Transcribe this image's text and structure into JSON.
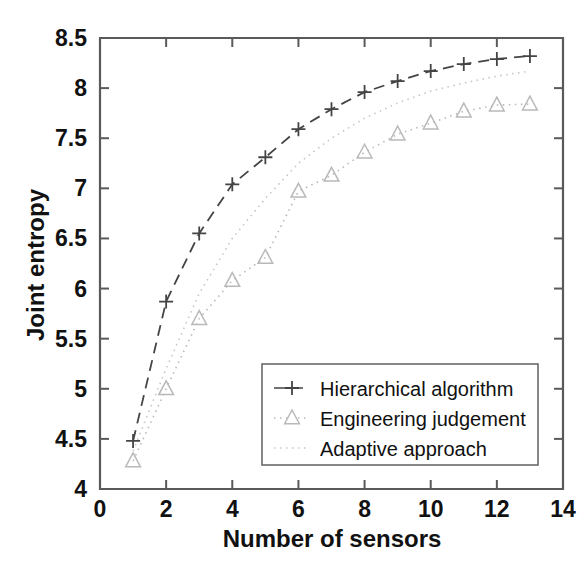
{
  "chart_data": {
    "type": "line",
    "title": "",
    "xlabel": "Number of sensors",
    "ylabel": "Joint entropy",
    "xlim": [
      0,
      14
    ],
    "ylim": [
      4,
      8.5
    ],
    "xticks": [
      0,
      2,
      4,
      6,
      8,
      10,
      12,
      14
    ],
    "yticks": [
      4,
      4.5,
      5,
      5.5,
      6,
      6.5,
      7,
      7.5,
      8,
      8.5
    ],
    "xticklabels": [
      "0",
      "2",
      "4",
      "6",
      "8",
      "10",
      "12",
      "14"
    ],
    "yticklabels": [
      "4",
      "4.5",
      "5",
      "5.5",
      "6",
      "6.5",
      "7",
      "7.5",
      "8",
      "8.5"
    ],
    "grid": false,
    "legend_position": "lower right",
    "x": [
      1,
      2,
      3,
      4,
      5,
      6,
      7,
      8,
      9,
      10,
      11,
      12,
      13
    ],
    "series": [
      {
        "name": "Hierarchical algorithm",
        "marker": "plus",
        "linestyle": "dashed",
        "color": "#444444",
        "values": [
          4.48,
          5.87,
          6.55,
          7.04,
          7.31,
          7.59,
          7.79,
          7.96,
          8.07,
          8.17,
          8.24,
          8.29,
          8.32
        ]
      },
      {
        "name": "Engineering judgement",
        "marker": "triangle",
        "linestyle": "dotted",
        "color": "#b9b9b9",
        "values": [
          4.28,
          5.0,
          5.7,
          6.08,
          6.31,
          6.97,
          7.13,
          7.36,
          7.54,
          7.65,
          7.77,
          7.83,
          7.84
        ]
      },
      {
        "name": "Adaptive approach",
        "marker": "none",
        "linestyle": "dotted",
        "color": "#c6c6c6",
        "values": [
          4.38,
          5.2,
          5.95,
          6.5,
          6.9,
          7.25,
          7.5,
          7.7,
          7.85,
          7.97,
          8.05,
          8.12,
          8.17
        ]
      }
    ]
  },
  "legend": {
    "entries": [
      {
        "label": "Hierarchical algorithm",
        "marker": "plus"
      },
      {
        "label": "Engineering judgement",
        "marker": "triangle"
      },
      {
        "label": "Adaptive approach",
        "marker": "dotted-line"
      }
    ]
  }
}
